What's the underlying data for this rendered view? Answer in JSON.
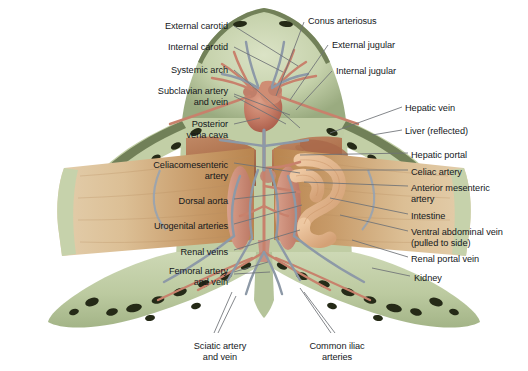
{
  "figure": {
    "background_color": "#ffffff",
    "label_color": "#15181c",
    "leader_color": "#6e7176",
    "palette": {
      "skin_green_light": "#cfd9b6",
      "skin_green_mid": "#bcc9a0",
      "skin_green_dark": "#8fa074",
      "skin_edge_olive": "#6d7a53",
      "spot_dark": "#262a18",
      "liver_tan": "#dcb388",
      "liver_tan_dark": "#c08f5f",
      "liver_reflected": "#b9774f",
      "muscle_salmon": "#c98872",
      "heart_red": "#c2705c",
      "artery_red": "#cb8573",
      "vein_blue": "#8e9aa8",
      "intestine_peach": "#e0b58f",
      "kidney_rose": "#c98a7a"
    }
  },
  "labels_left": [
    {
      "id": "external-carotid",
      "text": "External carotid",
      "x": 228,
      "y": 21,
      "lines": 1
    },
    {
      "id": "internal-carotid",
      "text": "Internal carotid",
      "x": 228,
      "y": 42,
      "lines": 1
    },
    {
      "id": "systemic-arch",
      "text": "Systemic arch",
      "x": 228,
      "y": 65,
      "lines": 1
    },
    {
      "id": "subclavian",
      "text": "Subclavian artery\nand vein",
      "x": 228,
      "y": 86,
      "lines": 2
    },
    {
      "id": "posterior-vena-cava",
      "text": "Posterior\nvena cava",
      "x": 228,
      "y": 119,
      "lines": 2
    },
    {
      "id": "celiacomesenteric",
      "text": "Celiacomesenteric\nartery",
      "x": 228,
      "y": 160,
      "lines": 2
    },
    {
      "id": "dorsal-aorta",
      "text": "Dorsal aorta",
      "x": 228,
      "y": 196,
      "lines": 1
    },
    {
      "id": "urogenital-arteries",
      "text": "Urogenital arteries",
      "x": 228,
      "y": 221,
      "lines": 1
    },
    {
      "id": "renal-veins",
      "text": "Renal veins",
      "x": 228,
      "y": 247,
      "lines": 1
    },
    {
      "id": "femoral",
      "text": "Femoral artery\nand vein",
      "x": 228,
      "y": 266,
      "lines": 2
    }
  ],
  "labels_right": [
    {
      "id": "conus-arteriosus",
      "text": "Conus arteriosus",
      "x": 308,
      "y": 16,
      "lines": 1
    },
    {
      "id": "external-jugular",
      "text": "External jugular",
      "x": 332,
      "y": 40,
      "lines": 1
    },
    {
      "id": "internal-jugular",
      "text": "Internal jugular",
      "x": 336,
      "y": 66,
      "lines": 1
    },
    {
      "id": "hepatic-vein",
      "text": "Hepatic vein",
      "x": 405,
      "y": 103,
      "lines": 1
    },
    {
      "id": "liver-reflected",
      "text": "Liver (reflected)",
      "x": 405,
      "y": 126,
      "lines": 1
    },
    {
      "id": "hepatic-portal",
      "text": "Hepatic portal",
      "x": 411,
      "y": 150,
      "lines": 1
    },
    {
      "id": "celiac-artery",
      "text": "Celiac artery",
      "x": 411,
      "y": 167,
      "lines": 1
    },
    {
      "id": "anterior-mesenteric",
      "text": "Anterior mesenteric\nartery",
      "x": 411,
      "y": 183,
      "lines": 2
    },
    {
      "id": "intestine",
      "text": "Intestine",
      "x": 411,
      "y": 211,
      "lines": 1
    },
    {
      "id": "ventral-abdominal",
      "text": "Ventral abdominal vein\n(pulled to side)",
      "x": 411,
      "y": 227,
      "lines": 2
    },
    {
      "id": "renal-portal-vein",
      "text": "Renal portal vein",
      "x": 411,
      "y": 254,
      "lines": 1
    },
    {
      "id": "kidney",
      "text": "Kidney",
      "x": 414,
      "y": 273,
      "lines": 1
    }
  ],
  "labels_bottom": [
    {
      "id": "sciatic",
      "text": "Sciatic artery\nand vein",
      "x": 220,
      "y": 341,
      "lines": 2
    },
    {
      "id": "common-iliac",
      "text": "Common iliac\narteries",
      "x": 337,
      "y": 341,
      "lines": 2
    }
  ],
  "leaders_left": [
    {
      "id": "external-carotid",
      "x1": 234,
      "y1": 26,
      "x2": 298,
      "y2": 66
    },
    {
      "id": "internal-carotid",
      "x1": 234,
      "y1": 47,
      "x2": 283,
      "y2": 72
    },
    {
      "id": "systemic-arch",
      "x1": 234,
      "y1": 70,
      "x2": 300,
      "y2": 128
    },
    {
      "id": "subclavian-a",
      "x1": 234,
      "y1": 94,
      "x2": 290,
      "y2": 115
    },
    {
      "id": "subclavian-b",
      "x1": 234,
      "y1": 96,
      "x2": 286,
      "y2": 124
    },
    {
      "id": "posterior-vena-cava",
      "x1": 234,
      "y1": 124,
      "x2": 260,
      "y2": 118
    },
    {
      "id": "celiacomesenteric",
      "x1": 234,
      "y1": 163,
      "x2": 300,
      "y2": 173
    },
    {
      "id": "dorsal-aorta",
      "x1": 234,
      "y1": 199,
      "x2": 296,
      "y2": 192
    },
    {
      "id": "urogenital-arteries",
      "x1": 234,
      "y1": 224,
      "x2": 302,
      "y2": 205
    },
    {
      "id": "renal-veins",
      "x1": 234,
      "y1": 250,
      "x2": 300,
      "y2": 230
    },
    {
      "id": "femoral-a",
      "x1": 234,
      "y1": 272,
      "x2": 268,
      "y2": 262
    },
    {
      "id": "femoral-b",
      "x1": 234,
      "y1": 274,
      "x2": 270,
      "y2": 272
    }
  ],
  "leaders_right": [
    {
      "id": "conus-arteriosus",
      "x1": 304,
      "y1": 22,
      "x2": 276,
      "y2": 96
    },
    {
      "id": "external-jugular",
      "x1": 328,
      "y1": 45,
      "x2": 290,
      "y2": 100
    },
    {
      "id": "internal-jugular",
      "x1": 332,
      "y1": 71,
      "x2": 296,
      "y2": 110
    },
    {
      "id": "hepatic-vein",
      "x1": 402,
      "y1": 107,
      "x2": 330,
      "y2": 133
    },
    {
      "id": "liver-reflected",
      "x1": 402,
      "y1": 130,
      "x2": 372,
      "y2": 135
    },
    {
      "id": "hepatic-portal",
      "x1": 408,
      "y1": 153,
      "x2": 300,
      "y2": 155
    },
    {
      "id": "celiac-artery",
      "x1": 408,
      "y1": 170,
      "x2": 306,
      "y2": 170
    },
    {
      "id": "anterior-mesenteric",
      "x1": 408,
      "y1": 186,
      "x2": 304,
      "y2": 182
    },
    {
      "id": "intestine",
      "x1": 408,
      "y1": 214,
      "x2": 330,
      "y2": 198
    },
    {
      "id": "ventral-abdominal",
      "x1": 408,
      "y1": 231,
      "x2": 340,
      "y2": 215
    },
    {
      "id": "renal-portal-vein",
      "x1": 408,
      "y1": 257,
      "x2": 352,
      "y2": 240
    },
    {
      "id": "kidney",
      "x1": 410,
      "y1": 276,
      "x2": 372,
      "y2": 268
    }
  ],
  "leaders_bottom": [
    {
      "id": "sciatic-a",
      "x1": 214,
      "y1": 333,
      "x2": 232,
      "y2": 292
    },
    {
      "id": "sciatic-b",
      "x1": 218,
      "y1": 333,
      "x2": 236,
      "y2": 296
    },
    {
      "id": "common-iliac-a",
      "x1": 331,
      "y1": 333,
      "x2": 300,
      "y2": 288
    },
    {
      "id": "common-iliac-b",
      "x1": 335,
      "y1": 333,
      "x2": 304,
      "y2": 292
    }
  ]
}
